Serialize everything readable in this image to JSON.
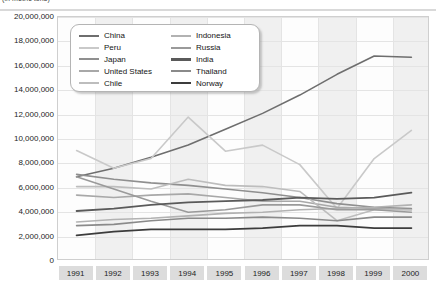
{
  "caption": {
    "text": "(in metric tons)"
  },
  "chart_data": {
    "type": "line",
    "title": "",
    "subtitle": "",
    "xlabel": "",
    "ylabel": "",
    "x": [
      1991,
      1992,
      1993,
      1994,
      1995,
      1996,
      1997,
      1998,
      1999,
      2000
    ],
    "categories": [
      "1991",
      "1992",
      "1993",
      "1994",
      "1995",
      "1996",
      "1997",
      "1998",
      "1999",
      "2000"
    ],
    "ylim": [
      0,
      20000000
    ],
    "ytick_values": [
      0,
      2000000,
      4000000,
      6000000,
      8000000,
      10000000,
      12000000,
      14000000,
      16000000,
      18000000,
      20000000
    ],
    "ytick_labels": [
      "0",
      "2,000,000",
      "4,000,000",
      "6,000,000",
      "8,000,000",
      "10,000,000",
      "12,000,000",
      "14,000,000",
      "16,000,000",
      "18,000,000",
      "20,000,000"
    ],
    "grid": true,
    "legend_position": "top-left",
    "series": [
      {
        "name": "China",
        "color": "#6e6e6e",
        "width": 1.6,
        "values": [
          6900000,
          7600000,
          8500000,
          9500000,
          10800000,
          12100000,
          13600000,
          15300000,
          16800000,
          16700000
        ]
      },
      {
        "name": "Peru",
        "color": "#c9c9c9",
        "width": 1.6,
        "values": [
          9050000,
          7600000,
          8400000,
          11800000,
          9000000,
          9500000,
          7900000,
          4300000,
          8400000,
          10700000
        ]
      },
      {
        "name": "Japan",
        "color": "#8f8f8f",
        "width": 1.6,
        "values": [
          7100000,
          6700000,
          6400000,
          6200000,
          5900000,
          5600000,
          5200000,
          4700000,
          4400000,
          4300000
        ]
      },
      {
        "name": "United States",
        "color": "#a8a8a8",
        "width": 1.6,
        "values": [
          5400000,
          5200000,
          5400000,
          5500000,
          5200000,
          4900000,
          4900000,
          4400000,
          4300000,
          4200000
        ]
      },
      {
        "name": "Chile",
        "color": "#bdbdbd",
        "width": 1.6,
        "values": [
          6100000,
          6100000,
          5900000,
          6700000,
          6200000,
          6100000,
          5700000,
          3300000,
          4200000,
          4200000
        ]
      },
      {
        "name": "Indonesia",
        "color": "#b2b2b2",
        "width": 1.6,
        "values": [
          3200000,
          3400000,
          3500000,
          3700000,
          3900000,
          4000000,
          4200000,
          4300000,
          4400000,
          4600000
        ]
      },
      {
        "name": "Russia",
        "color": "#9a9a9a",
        "width": 1.6,
        "values": [
          6900000,
          5900000,
          4900000,
          4000000,
          4200000,
          4600000,
          4600000,
          4200000,
          4200000,
          4000000
        ]
      },
      {
        "name": "India",
        "color": "#5a5a5a",
        "width": 1.8,
        "values": [
          4100000,
          4300000,
          4600000,
          4800000,
          4900000,
          5000000,
          5200000,
          5100000,
          5200000,
          5600000
        ]
      },
      {
        "name": "Thailand",
        "color": "#8a8a8a",
        "width": 1.6,
        "values": [
          2900000,
          3000000,
          3300000,
          3500000,
          3500000,
          3600000,
          3500000,
          3300000,
          3600000,
          3600000
        ]
      },
      {
        "name": "Norway",
        "color": "#3c3c3c",
        "width": 1.8,
        "values": [
          2100000,
          2400000,
          2600000,
          2600000,
          2600000,
          2700000,
          2900000,
          2900000,
          2700000,
          2700000
        ]
      }
    ]
  },
  "legend": {
    "left_column": [
      "China",
      "Peru",
      "Japan",
      "United States",
      "Chile"
    ],
    "right_column": [
      "Indonesia",
      "Russia",
      "India",
      "Thailand",
      "Norway"
    ]
  }
}
